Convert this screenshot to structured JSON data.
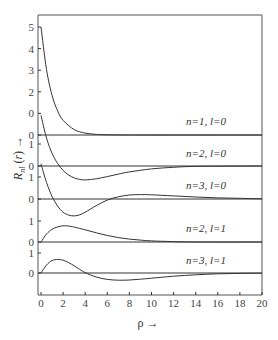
{
  "chart_data": {
    "type": "line",
    "title": "",
    "xlabel": "ρ →",
    "ylabel": "R_nl(r) →",
    "xlim": [
      0,
      20
    ],
    "x_ticks": [
      0,
      2,
      4,
      6,
      8,
      10,
      12,
      14,
      16,
      18,
      20
    ],
    "grid": false,
    "legend": "inline labels per panel",
    "panels": [
      {
        "name": "n=1, l=0",
        "label": "n=1, l=0",
        "y_tick_labels": [
          "0",
          "0",
          "2",
          "3",
          "4",
          "5"
        ],
        "y_ticks": [
          0,
          1,
          2,
          3,
          4,
          5
        ],
        "points": [
          [
            0,
            5.0
          ],
          [
            0.5,
            3.03
          ],
          [
            1,
            1.84
          ],
          [
            1.5,
            1.12
          ],
          [
            2,
            0.68
          ],
          [
            3,
            0.25
          ],
          [
            4,
            0.09
          ],
          [
            5,
            0.03
          ],
          [
            6,
            0.01
          ],
          [
            8,
            0.0
          ],
          [
            10,
            0.0
          ],
          [
            20,
            0.0
          ]
        ]
      },
      {
        "name": "n=2, l=0",
        "label": "n=2, l=0",
        "y_tick_labels": [
          "0",
          "1"
        ],
        "y_ticks": [
          0,
          1
        ],
        "points": [
          [
            0,
            2.3
          ],
          [
            0.5,
            1.27
          ],
          [
            1,
            0.58
          ],
          [
            1.5,
            0.12
          ],
          [
            2,
            -0.2
          ],
          [
            2.5,
            -0.41
          ],
          [
            3,
            -0.54
          ],
          [
            3.5,
            -0.61
          ],
          [
            4,
            -0.63
          ],
          [
            5,
            -0.58
          ],
          [
            6,
            -0.48
          ],
          [
            7,
            -0.37
          ],
          [
            8,
            -0.27
          ],
          [
            10,
            -0.13
          ],
          [
            12,
            -0.06
          ],
          [
            14,
            -0.02
          ],
          [
            20,
            0.0
          ]
        ]
      },
      {
        "name": "n=3, l=0",
        "label": "n=3, l=0",
        "y_tick_labels": [
          "0",
          "1"
        ],
        "y_ticks": [
          0,
          1
        ],
        "points": [
          [
            0,
            1.6
          ],
          [
            0.5,
            0.75
          ],
          [
            1,
            0.12
          ],
          [
            1.5,
            -0.32
          ],
          [
            2,
            -0.6
          ],
          [
            2.5,
            -0.73
          ],
          [
            3,
            -0.77
          ],
          [
            3.5,
            -0.72
          ],
          [
            4,
            -0.6
          ],
          [
            5,
            -0.3
          ],
          [
            6,
            -0.05
          ],
          [
            7,
            0.1
          ],
          [
            8,
            0.18
          ],
          [
            9,
            0.2
          ],
          [
            10,
            0.19
          ],
          [
            12,
            0.14
          ],
          [
            14,
            0.09
          ],
          [
            16,
            0.05
          ],
          [
            18,
            0.03
          ],
          [
            20,
            0.01
          ]
        ]
      },
      {
        "name": "n=2, l=1",
        "label": "n=2, l=1",
        "y_tick_labels": [
          "0",
          "1"
        ],
        "y_ticks": [
          0,
          1
        ],
        "points": [
          [
            0,
            0.0
          ],
          [
            0.5,
            0.38
          ],
          [
            1,
            0.6
          ],
          [
            1.5,
            0.72
          ],
          [
            2,
            0.77
          ],
          [
            2.5,
            0.76
          ],
          [
            3,
            0.71
          ],
          [
            4,
            0.58
          ],
          [
            5,
            0.44
          ],
          [
            6,
            0.31
          ],
          [
            7,
            0.21
          ],
          [
            8,
            0.14
          ],
          [
            9,
            0.09
          ],
          [
            10,
            0.05
          ],
          [
            12,
            0.02
          ],
          [
            14,
            0.0
          ],
          [
            20,
            0.0
          ]
        ]
      },
      {
        "name": "n=3, l=1",
        "label": "n=3, l=1",
        "y_tick_labels": [
          "0",
          "1"
        ],
        "y_ticks": [
          0,
          1
        ],
        "points": [
          [
            0,
            0.0
          ],
          [
            0.5,
            0.4
          ],
          [
            1,
            0.62
          ],
          [
            1.5,
            0.68
          ],
          [
            2,
            0.64
          ],
          [
            2.5,
            0.52
          ],
          [
            3,
            0.36
          ],
          [
            3.5,
            0.18
          ],
          [
            4,
            0.02
          ],
          [
            5,
            -0.2
          ],
          [
            6,
            -0.32
          ],
          [
            7,
            -0.36
          ],
          [
            8,
            -0.35
          ],
          [
            9,
            -0.31
          ],
          [
            10,
            -0.26
          ],
          [
            12,
            -0.16
          ],
          [
            14,
            -0.09
          ],
          [
            16,
            -0.04
          ],
          [
            18,
            -0.02
          ],
          [
            20,
            -0.01
          ]
        ]
      }
    ]
  },
  "layout": {
    "plot_left": 41,
    "plot_right": 262,
    "plot_top": 15,
    "plot_bottom": 295,
    "frame_left": 38,
    "baselines_px": [
      135,
      166,
      199,
      242,
      273
    ],
    "unit_px": [
      21.6,
      22,
      22,
      21,
      20
    ],
    "label_positions": [
      [
        206,
        125
      ],
      [
        206,
        157
      ],
      [
        206,
        189
      ],
      [
        206,
        232
      ],
      [
        206,
        264
      ]
    ],
    "colors": {
      "line": "#333333",
      "text": "#333333",
      "background": "#ffffff"
    }
  }
}
